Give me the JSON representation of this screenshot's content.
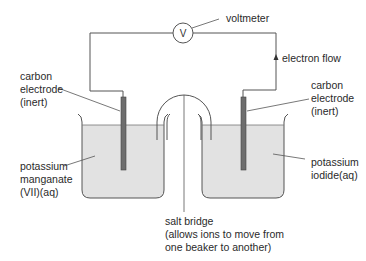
{
  "diagram": {
    "type": "electrochemical cell",
    "labels": {
      "voltmeter": "voltmeter",
      "voltmeter_symbol": "V",
      "electron_flow": "electron flow",
      "left_electrode": [
        "carbon",
        "electrode",
        "(inert)"
      ],
      "right_electrode": [
        "carbon",
        "electrode",
        "(inert)"
      ],
      "left_solution": [
        "potassium",
        "manganate",
        "(VII)(aq)"
      ],
      "right_solution": [
        "potassium",
        "iodide(aq)"
      ],
      "salt_bridge": [
        "salt bridge",
        "(allows ions to move from",
        "one beaker to another)"
      ]
    },
    "colors": {
      "line": "#555555",
      "solution": "#e2e2e2",
      "electrode": "#6e6e6e"
    }
  }
}
